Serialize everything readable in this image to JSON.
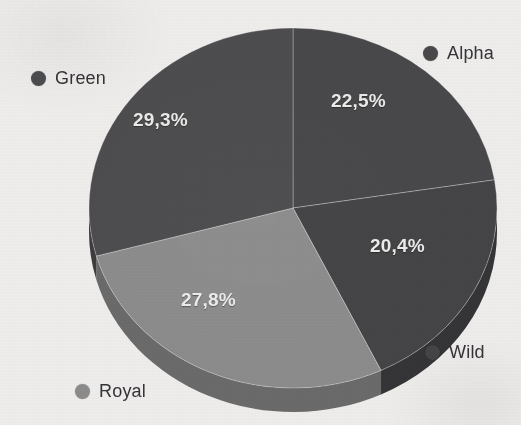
{
  "chart_data": {
    "type": "pie",
    "title": "",
    "subtitle": "",
    "xlabel": "",
    "ylabel": "",
    "grid": false,
    "legend_position": "around-chart",
    "three_d": true,
    "decimal_separator": ",",
    "categories": [
      "Alpha",
      "Wild",
      "Royal",
      "Green"
    ],
    "values": [
      22.5,
      20.4,
      27.8,
      29.3
    ],
    "labels": [
      "22,5%",
      "20,4%",
      "27,8%",
      "29,3%"
    ],
    "colors": [
      "#4a4a4c",
      "#464648",
      "#8f8f90",
      "#4f4f51"
    ],
    "slices": [
      {
        "name": "Alpha",
        "value": 22.5,
        "label": "22,5%",
        "color": "#4a4a4c",
        "side_color": "#3a3a3c",
        "start_deg": 0.0,
        "end_deg": 81.0
      },
      {
        "name": "Wild",
        "value": 20.4,
        "label": "20,4%",
        "color": "#464648",
        "side_color": "#363638",
        "start_deg": 81.0,
        "end_deg": 154.44
      },
      {
        "name": "Royal",
        "value": 27.8,
        "label": "27,8%",
        "color": "#8f8f90",
        "side_color": "#6d6d6e",
        "start_deg": 154.44,
        "end_deg": 254.52
      },
      {
        "name": "Green",
        "value": 29.3,
        "label": "29,3%",
        "color": "#4f4f51",
        "side_color": "#3e3e40",
        "start_deg": 254.52,
        "end_deg": 360.0
      }
    ]
  },
  "legend": {
    "alpha": {
      "label": "Alpha",
      "color": "#4a4a4c"
    },
    "green": {
      "label": "Green",
      "color": "#4f4f51"
    },
    "royal": {
      "label": "Royal",
      "color": "#8f8f90"
    },
    "wild": {
      "label": "Wild",
      "color": "#464648"
    }
  },
  "labels": {
    "alpha": "22,5%",
    "wild": "20,4%",
    "royal": "27,8%",
    "green": "29,3%"
  },
  "canvas": {
    "background": "#f4f3f1",
    "label_text_color": "#f0f0ee",
    "legend_text_color": "#35353a"
  }
}
